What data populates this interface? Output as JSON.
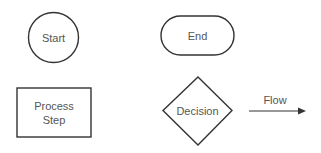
{
  "diagram": {
    "type": "flowchart-legend",
    "colors": {
      "stroke": "#333333",
      "text": "#555555",
      "fill": "#ffffff",
      "background": "#ffffff"
    },
    "shapes": [
      {
        "id": "start",
        "shape": "circle",
        "label": "Start"
      },
      {
        "id": "end",
        "shape": "rounded-pill",
        "label": "End"
      },
      {
        "id": "process",
        "shape": "rectangle",
        "label_lines": [
          "Process",
          "Step"
        ]
      },
      {
        "id": "decision",
        "shape": "diamond",
        "label": "Decision"
      }
    ],
    "connector": {
      "id": "flow",
      "shape": "arrow",
      "label": "Flow"
    }
  }
}
